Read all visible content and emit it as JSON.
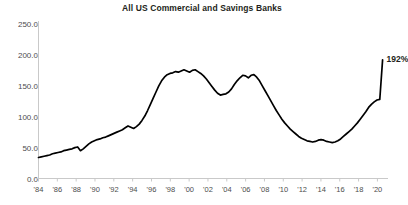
{
  "chart_data": {
    "type": "line",
    "title": "All US Commercial and Savings Banks",
    "xlabel": "",
    "ylabel": "",
    "ylim": [
      0,
      250
    ],
    "yticks": [
      "0.0",
      "50.0",
      "100.0",
      "150.0",
      "200.0",
      "250.0"
    ],
    "ytick_values": [
      0,
      50,
      100,
      150,
      200,
      250
    ],
    "xlim": [
      1984,
      2020.7
    ],
    "xticks": [
      "'84",
      "'86",
      "'88",
      "'90",
      "'92",
      "'94",
      "'96",
      "'98",
      "'00",
      "'02",
      "'04",
      "'06",
      "'08",
      "'10",
      "'12",
      "'14",
      "'16",
      "'18",
      "'20"
    ],
    "xtick_values": [
      1984,
      1986,
      1988,
      1990,
      1992,
      1994,
      1996,
      1998,
      2000,
      2002,
      2004,
      2006,
      2008,
      2010,
      2012,
      2014,
      2016,
      2018,
      2020
    ],
    "grid": false,
    "legend": null,
    "line_color": "#000000",
    "axis_color": "#c9c9c9",
    "annotations": [
      {
        "label": "192%",
        "x": 2020.6,
        "y": 192
      }
    ],
    "series": [
      {
        "name": "All US Commercial and Savings Banks",
        "x": [
          1984.0,
          1984.5,
          1985.0,
          1985.5,
          1986.0,
          1986.5,
          1987.0,
          1987.5,
          1988.0,
          1988.5,
          1989.0,
          1989.5,
          1990.0,
          1990.5,
          1991.0,
          1991.5,
          1992.0,
          1992.5,
          1993.0,
          1993.5,
          1994.0,
          1994.5,
          1995.0,
          1995.5,
          1996.0,
          1996.5,
          1997.0,
          1997.5,
          1998.0,
          1998.5,
          1999.0,
          1999.5,
          2000.0,
          2000.5,
          2001.0,
          2001.5,
          2002.0,
          2002.5,
          2003.0,
          2003.5,
          2004.0,
          2004.5,
          2005.0,
          2005.5,
          2006.0,
          2006.5,
          2007.0,
          2007.5,
          2008.0,
          2008.5,
          2009.0,
          2009.5,
          2010.0,
          2010.5,
          2011.0,
          2011.5,
          2012.0,
          2012.5,
          2013.0,
          2013.5,
          2014.0,
          2014.5,
          2015.0,
          2015.5,
          2016.0,
          2016.5,
          2017.0,
          2017.5,
          2018.0,
          2018.5,
          2019.0,
          2019.5,
          2020.0,
          2020.15,
          2020.3,
          2020.5
        ],
        "y": [
          34,
          35,
          37,
          38,
          40,
          41,
          43,
          44,
          46,
          47,
          49,
          50,
          51,
          44,
          49,
          56,
          60,
          63,
          65,
          68,
          70,
          72,
          75,
          78,
          84,
          80,
          86,
          95,
          108,
          125,
          140,
          155,
          163,
          170,
          172,
          176,
          172,
          175,
          168,
          160,
          150,
          143,
          138,
          136,
          140,
          148,
          158,
          166,
          172,
          170,
          166,
          163,
          168,
          167,
          160,
          148,
          140,
          128,
          115,
          102,
          92,
          84,
          74,
          68,
          63,
          60,
          58,
          57,
          62,
          63,
          62,
          58,
          60,
          63,
          70,
          78
        ],
        "units": "percent"
      }
    ],
    "series_detail_note": "Line traced from screenshot pixels; values are ratio (%) readings on the 0-250 axis.",
    "full_path_y": [
      34,
      35,
      36,
      37,
      38,
      40,
      41,
      42,
      43,
      45,
      46,
      47,
      48,
      50,
      51,
      45,
      48,
      52,
      56,
      59,
      61,
      63,
      64,
      66,
      67,
      69,
      71,
      73,
      75,
      77,
      79,
      82,
      85,
      83,
      81,
      84,
      88,
      94,
      101,
      110,
      120,
      130,
      140,
      150,
      158,
      164,
      168,
      170,
      171,
      173,
      172,
      174,
      176,
      174,
      172,
      175,
      176,
      173,
      170,
      166,
      161,
      155,
      149,
      143,
      138,
      135,
      136,
      137,
      140,
      145,
      152,
      158,
      163,
      167,
      166,
      163,
      167,
      168,
      164,
      158,
      150,
      142,
      134,
      126,
      118,
      110,
      103,
      96,
      90,
      85,
      80,
      76,
      72,
      68,
      65,
      63,
      61,
      60,
      59,
      60,
      62,
      63,
      62,
      60,
      59,
      58,
      59,
      61,
      64,
      68,
      72,
      76,
      80,
      85,
      90,
      96,
      102,
      108,
      115,
      120,
      124,
      127,
      128,
      192
    ]
  }
}
